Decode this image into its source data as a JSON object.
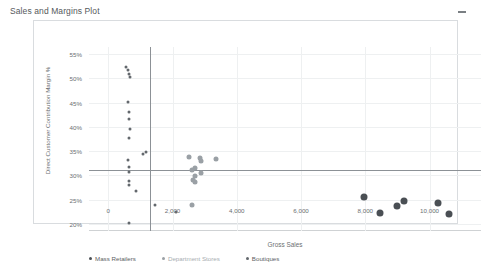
{
  "panel": {
    "title": "Sales and Margins Plot",
    "minimize_icon": "minimize-icon"
  },
  "chart_data": {
    "type": "scatter",
    "title": "Sales and Margins Plot",
    "xlabel": "Gross Sales",
    "ylabel": "Direct Customer Contribution Margin %",
    "xlim": [
      -600,
      11600
    ],
    "ylim": [
      18.5,
      56.5
    ],
    "xticks": [
      0,
      2000,
      4000,
      6000,
      8000,
      10000
    ],
    "xticklabels": [
      "0",
      "2,000",
      "4,000",
      "6,000",
      "8,000",
      "10,000"
    ],
    "yticks": [
      20,
      25,
      30,
      35,
      40,
      45,
      50,
      55
    ],
    "yticklabels": [
      "20%",
      "25%",
      "30%",
      "35%",
      "40%",
      "45%",
      "50%",
      "55%"
    ],
    "grid": true,
    "legend_position": "bottom-left",
    "reference_lines": [
      {
        "axis": "x",
        "value": 1300,
        "color": "#8c9196"
      },
      {
        "axis": "y",
        "value": 31.0,
        "color": "#8c9196"
      }
    ],
    "series": [
      {
        "name": "Mass Retailers",
        "color": "#4a4f54",
        "marker_size": 7,
        "points": [
          {
            "x": 7950,
            "y": 25.6
          },
          {
            "x": 8450,
            "y": 22.3
          },
          {
            "x": 9000,
            "y": 23.6
          },
          {
            "x": 9200,
            "y": 24.6
          },
          {
            "x": 10250,
            "y": 24.3
          },
          {
            "x": 10600,
            "y": 22.1
          }
        ]
      },
      {
        "name": "Department Stores",
        "color": "#9aa0a5",
        "marker_size": 5,
        "points": [
          {
            "x": 2500,
            "y": 33.8
          },
          {
            "x": 2700,
            "y": 31.6
          },
          {
            "x": 2600,
            "y": 31.0
          },
          {
            "x": 2700,
            "y": 29.9
          },
          {
            "x": 2850,
            "y": 33.5
          },
          {
            "x": 2900,
            "y": 32.9
          },
          {
            "x": 2880,
            "y": 30.4
          },
          {
            "x": 2650,
            "y": 29.1
          },
          {
            "x": 2700,
            "y": 28.6
          },
          {
            "x": 3350,
            "y": 33.4
          },
          {
            "x": 2600,
            "y": 23.9
          }
        ]
      },
      {
        "name": "Boutiques",
        "color": "#63686d",
        "marker_size": 3,
        "points": [
          {
            "x": 560,
            "y": 52.3
          },
          {
            "x": 600,
            "y": 51.7
          },
          {
            "x": 640,
            "y": 51.0
          },
          {
            "x": 690,
            "y": 50.3
          },
          {
            "x": 620,
            "y": 45.2
          },
          {
            "x": 660,
            "y": 43.0
          },
          {
            "x": 640,
            "y": 41.6
          },
          {
            "x": 680,
            "y": 39.6
          },
          {
            "x": 660,
            "y": 37.8
          },
          {
            "x": 1080,
            "y": 34.5
          },
          {
            "x": 1180,
            "y": 34.9
          },
          {
            "x": 600,
            "y": 33.2
          },
          {
            "x": 660,
            "y": 31.8
          },
          {
            "x": 660,
            "y": 30.6
          },
          {
            "x": 630,
            "y": 28.9
          },
          {
            "x": 640,
            "y": 27.9
          },
          {
            "x": 850,
            "y": 26.8
          },
          {
            "x": 1450,
            "y": 23.8
          },
          {
            "x": 2100,
            "y": 22.5
          },
          {
            "x": 660,
            "y": 20.2
          }
        ]
      }
    ]
  }
}
